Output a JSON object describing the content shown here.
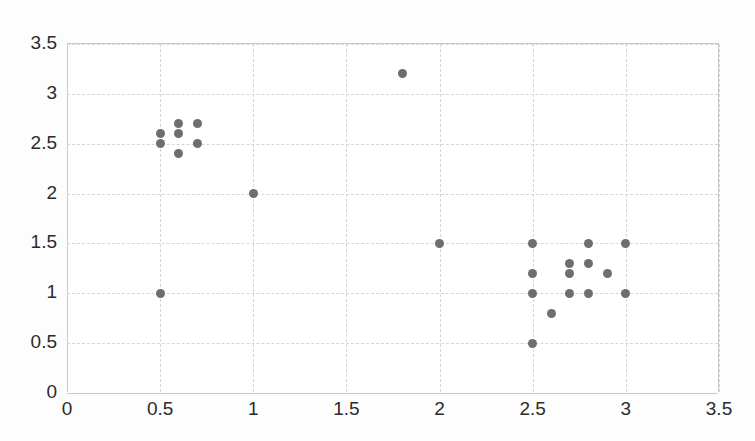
{
  "chart_data": {
    "type": "scatter",
    "title": "",
    "xlabel": "",
    "ylabel": "",
    "xlim": [
      0,
      3.5
    ],
    "ylim": [
      0,
      3.5
    ],
    "xticks": [
      "0",
      "0.5",
      "1",
      "1.5",
      "2",
      "2.5",
      "3",
      "3.5"
    ],
    "yticks": [
      "0",
      "0.5",
      "1",
      "1.5",
      "2",
      "2.5",
      "3",
      "3.5"
    ],
    "xtick_values": [
      0,
      0.5,
      1,
      1.5,
      2,
      2.5,
      3,
      3.5
    ],
    "ytick_values": [
      0,
      0.5,
      1,
      1.5,
      2,
      2.5,
      3,
      3.5
    ],
    "grid": true,
    "legend": "none",
    "marker_color": "#6e6e6e",
    "marker_shape": "circle",
    "gridline_color": "#d6d6d6",
    "axis_color": "#c8c8c8",
    "series": [
      {
        "name": "points",
        "points": [
          [
            0.5,
            2.6
          ],
          [
            0.5,
            2.5
          ],
          [
            0.6,
            2.7
          ],
          [
            0.6,
            2.6
          ],
          [
            0.6,
            2.4
          ],
          [
            0.7,
            2.7
          ],
          [
            0.7,
            2.5
          ],
          [
            0.5,
            1.0
          ],
          [
            1.0,
            2.0
          ],
          [
            1.8,
            3.2
          ],
          [
            2.0,
            1.5
          ],
          [
            2.5,
            1.5
          ],
          [
            2.5,
            1.2
          ],
          [
            2.5,
            1.0
          ],
          [
            2.5,
            0.5
          ],
          [
            2.6,
            0.8
          ],
          [
            2.7,
            1.3
          ],
          [
            2.7,
            1.2
          ],
          [
            2.7,
            1.0
          ],
          [
            2.8,
            1.5
          ],
          [
            2.8,
            1.3
          ],
          [
            2.8,
            1.0
          ],
          [
            2.9,
            1.2
          ],
          [
            3.0,
            1.5
          ],
          [
            3.0,
            1.0
          ]
        ]
      }
    ]
  }
}
